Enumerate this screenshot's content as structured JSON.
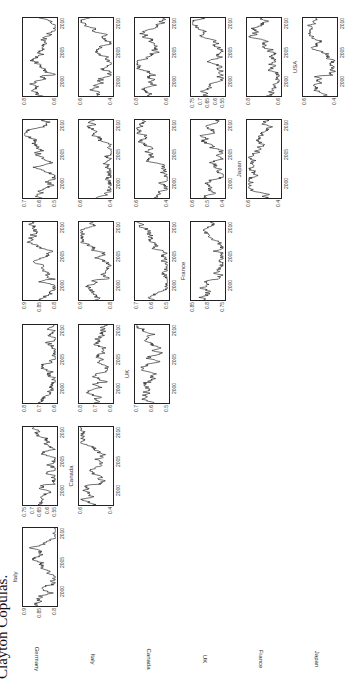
{
  "caption": "Clayton Copulas.",
  "rows": [
    "Germany",
    "Italy",
    "Canada",
    "UK",
    "France",
    "Japan"
  ],
  "columns": [
    "Italy",
    "Canada",
    "UK",
    "France",
    "Japan",
    "USA"
  ],
  "x_ticks": [
    "2000",
    "2005",
    "2010"
  ],
  "chart_data": {
    "type": "line",
    "title": "Clayton Copulas.",
    "layout": "6x6 lower-triangular grid of time-series panels (page rotated 90°)",
    "xlabel": "",
    "ylabel": "",
    "xlim": [
      1997,
      2010
    ],
    "x_ticks": [
      2000,
      2005,
      2010
    ],
    "grid": false,
    "panels": [
      {
        "row": "Germany",
        "col": "Italy",
        "y_ticks": [
          "0.9",
          "0.85",
          "0.8"
        ],
        "ylim": [
          0.78,
          0.92
        ]
      },
      {
        "row": "Germany",
        "col": "Canada",
        "y_ticks": [
          "0.75",
          "0.7",
          "0.65",
          "0.6",
          "0.55"
        ],
        "ylim": [
          0.53,
          0.77
        ]
      },
      {
        "row": "Germany",
        "col": "UK",
        "y_ticks": [
          "0.8",
          "0.7",
          "0.6"
        ],
        "ylim": [
          0.58,
          0.84
        ]
      },
      {
        "row": "Germany",
        "col": "France",
        "y_ticks": [
          "0.9",
          "0.85",
          "0.8"
        ],
        "ylim": [
          0.78,
          0.92
        ]
      },
      {
        "row": "Germany",
        "col": "Japan",
        "y_ticks": [
          "0.7",
          "0.6",
          "0.5"
        ],
        "ylim": [
          0.48,
          0.74
        ]
      },
      {
        "row": "Germany",
        "col": "USA",
        "y_ticks": [
          "0.8",
          "0.6"
        ],
        "ylim": [
          0.5,
          0.85
        ]
      },
      {
        "row": "Italy",
        "col": "Canada",
        "y_ticks": [
          "0.6",
          "0.4"
        ],
        "ylim": [
          0.38,
          0.68
        ]
      },
      {
        "row": "Italy",
        "col": "UK",
        "y_ticks": [
          "0.8",
          "0.7",
          "0.6"
        ],
        "ylim": [
          0.58,
          0.84
        ]
      },
      {
        "row": "Italy",
        "col": "France",
        "y_ticks": [
          "0.9",
          "0.8"
        ],
        "ylim": [
          0.76,
          0.94
        ]
      },
      {
        "row": "Italy",
        "col": "Japan",
        "y_ticks": [
          "0.6",
          "0.4"
        ],
        "ylim": [
          0.36,
          0.66
        ]
      },
      {
        "row": "Italy",
        "col": "USA",
        "y_ticks": [
          "0.6",
          "0.4"
        ],
        "ylim": [
          0.36,
          0.7
        ]
      },
      {
        "row": "Canada",
        "col": "UK",
        "y_ticks": [
          "0.7",
          "0.6",
          "0.5"
        ],
        "ylim": [
          0.48,
          0.74
        ]
      },
      {
        "row": "Canada",
        "col": "France",
        "y_ticks": [
          "0.7",
          "0.6",
          "0.5"
        ],
        "ylim": [
          0.48,
          0.74
        ]
      },
      {
        "row": "Canada",
        "col": "Japan",
        "y_ticks": [
          "0.6",
          "0.4"
        ],
        "ylim": [
          0.36,
          0.66
        ]
      },
      {
        "row": "Canada",
        "col": "USA",
        "y_ticks": [
          "0.8",
          "0.6"
        ],
        "ylim": [
          0.5,
          0.85
        ]
      },
      {
        "row": "UK",
        "col": "France",
        "y_ticks": [
          "0.85",
          "0.8",
          "0.75"
        ],
        "ylim": [
          0.73,
          0.87
        ]
      },
      {
        "row": "UK",
        "col": "Japan",
        "y_ticks": [
          "0.6",
          "0.5",
          "0.4"
        ],
        "ylim": [
          0.38,
          0.64
        ]
      },
      {
        "row": "UK",
        "col": "USA",
        "y_ticks": [
          "0.75",
          "0.7",
          "0.65",
          "0.6",
          "0.55"
        ],
        "ylim": [
          0.53,
          0.77
        ]
      },
      {
        "row": "France",
        "col": "Japan",
        "y_ticks": [
          "0.6",
          "0.4"
        ],
        "ylim": [
          0.36,
          0.66
        ]
      },
      {
        "row": "France",
        "col": "USA",
        "y_ticks": [
          "0.8",
          "0.6"
        ],
        "ylim": [
          0.5,
          0.85
        ]
      },
      {
        "row": "Japan",
        "col": "USA",
        "y_ticks": [
          "0.6",
          "0.4"
        ],
        "ylim": [
          0.36,
          0.66
        ]
      }
    ]
  }
}
